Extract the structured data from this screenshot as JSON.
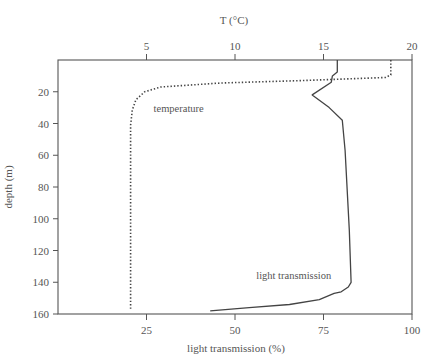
{
  "chart_data": {
    "type": "line",
    "title": "",
    "top_axis": {
      "label": "T (°C)",
      "ticks": [
        5,
        10,
        15,
        20
      ],
      "range": [
        0,
        20
      ]
    },
    "bottom_axis": {
      "label": "light transmission (%)",
      "ticks": [
        25,
        50,
        75,
        100
      ],
      "range": [
        0,
        100
      ]
    },
    "ylabel": "depth (m)",
    "yticks": [
      20,
      40,
      60,
      80,
      100,
      120,
      140,
      160
    ],
    "ylim": [
      0,
      160
    ],
    "y_inverted": true,
    "grid": false,
    "legend": "inline labels",
    "series": [
      {
        "name": "temperature",
        "axis": "top",
        "style": "dotted",
        "label_position": {
          "x_value": 5.4,
          "depth": 33
        },
        "points": [
          {
            "x": 18.8,
            "depth": 0
          },
          {
            "x": 18.8,
            "depth": 9.4
          },
          {
            "x": 18.5,
            "depth": 11
          },
          {
            "x": 13.7,
            "depth": 13
          },
          {
            "x": 9.2,
            "depth": 14.5
          },
          {
            "x": 5.8,
            "depth": 17
          },
          {
            "x": 4.9,
            "depth": 20
          },
          {
            "x": 4.4,
            "depth": 25
          },
          {
            "x": 4.2,
            "depth": 31.5
          },
          {
            "x": 4.1,
            "depth": 41
          },
          {
            "x": 4.1,
            "depth": 157.5
          }
        ]
      },
      {
        "name": "light transmission",
        "axis": "bottom",
        "style": "solid",
        "label_position": {
          "x_value": 56,
          "depth": 138
        },
        "points": [
          {
            "x": 78.9,
            "depth": 0
          },
          {
            "x": 78.9,
            "depth": 7.6
          },
          {
            "x": 77.5,
            "depth": 10
          },
          {
            "x": 77.2,
            "depth": 14
          },
          {
            "x": 71.8,
            "depth": 22
          },
          {
            "x": 76.6,
            "depth": 30
          },
          {
            "x": 80.3,
            "depth": 38
          },
          {
            "x": 81.1,
            "depth": 57
          },
          {
            "x": 82.3,
            "depth": 107
          },
          {
            "x": 82.8,
            "depth": 140
          },
          {
            "x": 82.0,
            "depth": 143
          },
          {
            "x": 80.0,
            "depth": 146
          },
          {
            "x": 78.0,
            "depth": 147
          },
          {
            "x": 73.8,
            "depth": 151
          },
          {
            "x": 65.4,
            "depth": 154
          },
          {
            "x": 54.0,
            "depth": 156
          },
          {
            "x": 43.0,
            "depth": 158
          }
        ]
      }
    ]
  },
  "colors": {
    "axis": "#555555",
    "line": "#444444",
    "text": "#555555"
  }
}
